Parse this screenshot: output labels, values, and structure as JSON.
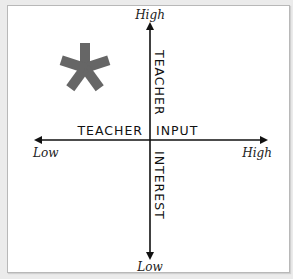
{
  "diagram": {
    "type": "quadrant-axes",
    "vertical_axis": {
      "top_label": "High",
      "bottom_label": "Low",
      "upper_title": "TEACHER",
      "lower_title": "INTEREST"
    },
    "horizontal_axis": {
      "left_label": "Low",
      "right_label": "High",
      "left_title": "TEACHER",
      "right_title": "INPUT"
    },
    "marker": {
      "symbol": "*",
      "quadrant": "top-left",
      "color": "#666666"
    },
    "colors": {
      "axis": "#111111",
      "background": "#ffffff",
      "frame_border": "#b8b8b8"
    }
  }
}
